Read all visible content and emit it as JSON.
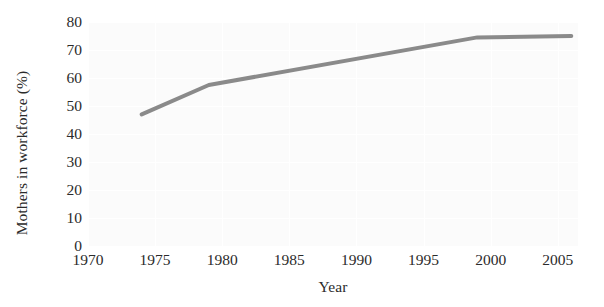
{
  "chart_data": {
    "type": "line",
    "title": "",
    "xlabel": "Year",
    "ylabel": "Mothers in workforce (%)",
    "xlim": [
      1970,
      2006.5
    ],
    "ylim": [
      0,
      80
    ],
    "xticks": [
      1970,
      1975,
      1980,
      1985,
      1990,
      1995,
      2000,
      2005
    ],
    "xtick_labels": [
      "1970",
      "1975",
      "1980",
      "1985",
      "1990",
      "1995",
      "2000",
      "2005"
    ],
    "yticks": [
      0,
      10,
      20,
      30,
      40,
      50,
      60,
      70,
      80
    ],
    "ytick_labels": [
      "0",
      "10",
      "20",
      "30",
      "40",
      "50",
      "60",
      "70",
      "80"
    ],
    "grid": true,
    "legend": "none",
    "series": [
      {
        "name": "Mothers in workforce",
        "color": "#8a8a8a",
        "linewidth": 4,
        "x": [
          1974,
          1979,
          1999,
          2006
        ],
        "values": [
          47,
          57.5,
          74.5,
          75
        ]
      }
    ],
    "points": [
      {
        "x": 1974,
        "y": 47
      },
      {
        "x": 1979,
        "y": 57.5
      },
      {
        "x": 1999,
        "y": 74.5
      },
      {
        "x": 2006,
        "y": 75
      }
    ]
  },
  "axes": {
    "y_title": "Mothers in workforce (%)",
    "x_title": "Year"
  },
  "colors": {
    "line": "#8a8a8a",
    "plot_background": "#fbfbfb",
    "grid": "#ffffff",
    "text": "#2b2b2b",
    "page_background": "#ffffff"
  }
}
